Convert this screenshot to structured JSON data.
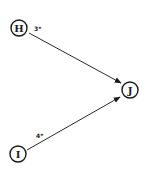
{
  "diagram": {
    "type": "directed-graph",
    "nodes": [
      {
        "id": "H",
        "label": "H"
      },
      {
        "id": "I",
        "label": "I"
      },
      {
        "id": "J",
        "label": "J"
      }
    ],
    "edges": [
      {
        "from": "H",
        "to": "J",
        "label": "3*"
      },
      {
        "from": "I",
        "to": "J",
        "label": "4*"
      }
    ],
    "colors": {
      "stroke": "#1a1a1a",
      "background": "#ffffff"
    }
  }
}
